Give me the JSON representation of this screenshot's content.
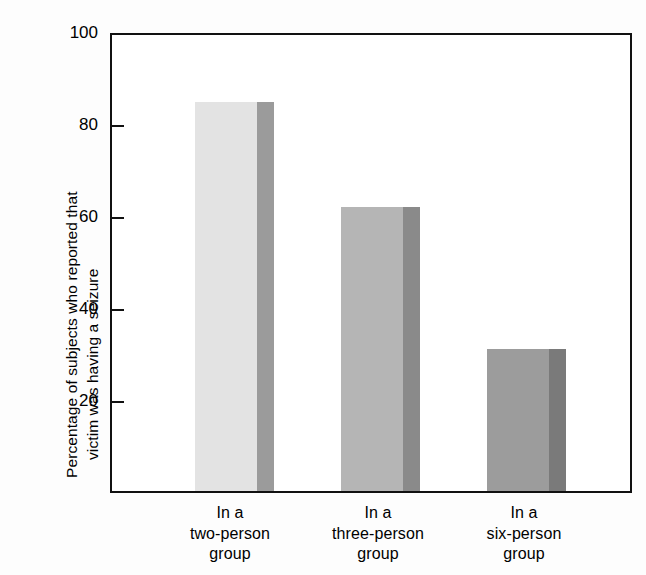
{
  "chart_data": {
    "type": "bar",
    "title": "",
    "xlabel": "",
    "ylabel_line1": "Percentage of subjects who reported that",
    "ylabel_line2": "victim was having a seizure",
    "categories": [
      "In a\ntwo-person\ngroup",
      "In a\nthree-person\ngroup",
      "In a\nsix-person\ngroup"
    ],
    "category_lines": [
      [
        "In a",
        "two-person",
        "group"
      ],
      [
        "In a",
        "three-person",
        "group"
      ],
      [
        "In a",
        "six-person",
        "group"
      ]
    ],
    "values": [
      85,
      62,
      31
    ],
    "ylim": [
      0,
      100
    ],
    "yticks": [
      100,
      80,
      60,
      40,
      20
    ],
    "ytick_labels": [
      "100",
      "80",
      "60",
      "40",
      "20"
    ],
    "grid": false,
    "legend": "none",
    "style": "3d-bars-grayscale"
  },
  "colors": {
    "axis": "#111111",
    "background": "#ffffff",
    "bar1_face": "#e3e3e3",
    "bar1_side": "#9b9b9b",
    "bar2_face": "#b5b5b5",
    "bar2_side": "#8a8a8a",
    "bar3_face": "#9c9c9c",
    "bar3_side": "#7a7a7a"
  }
}
